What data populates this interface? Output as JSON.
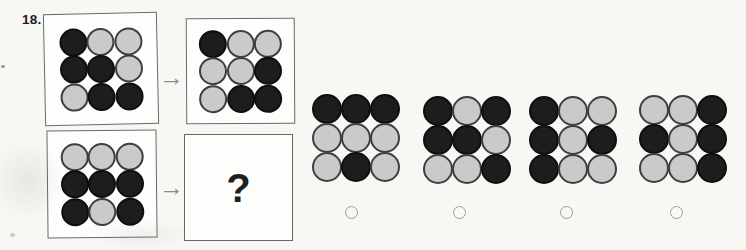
{
  "question": {
    "number": "18.",
    "question_mark": "?"
  },
  "icons": {
    "arrow": "→"
  },
  "colors": {
    "paper": "#f7f7f4",
    "box_bg": "#fdfdfc",
    "box_border": "#686868",
    "dark": "#1d1d1d",
    "dark_ring": "#0e0e0e",
    "light": "#cacaca",
    "light_ring": "#3e3e3e",
    "arrow": "#8d8d8d",
    "radio_border": "#9c9c9c"
  },
  "example": {
    "input_grid": [
      [
        "dark",
        "light",
        "light"
      ],
      [
        "dark",
        "dark",
        "light"
      ],
      [
        "light",
        "dark",
        "dark"
      ]
    ],
    "output_grid": [
      [
        "dark",
        "light",
        "light"
      ],
      [
        "light",
        "light",
        "dark"
      ],
      [
        "light",
        "dark",
        "dark"
      ]
    ]
  },
  "problem": {
    "input_grid": [
      [
        "light",
        "light",
        "light"
      ],
      [
        "dark",
        "dark",
        "dark"
      ],
      [
        "dark",
        "light",
        "dark"
      ]
    ]
  },
  "options": [
    {
      "id": "option-1",
      "grid": [
        [
          "dark",
          "dark",
          "dark"
        ],
        [
          "light",
          "light",
          "light"
        ],
        [
          "light",
          "dark",
          "light"
        ]
      ],
      "selected": false
    },
    {
      "id": "option-2",
      "grid": [
        [
          "dark",
          "light",
          "dark"
        ],
        [
          "dark",
          "dark",
          "light"
        ],
        [
          "light",
          "light",
          "dark"
        ]
      ],
      "selected": false
    },
    {
      "id": "option-3",
      "grid": [
        [
          "dark",
          "light",
          "light"
        ],
        [
          "dark",
          "light",
          "dark"
        ],
        [
          "dark",
          "light",
          "light"
        ]
      ],
      "selected": false
    },
    {
      "id": "option-4",
      "grid": [
        [
          "light",
          "light",
          "dark"
        ],
        [
          "dark",
          "light",
          "dark"
        ],
        [
          "light",
          "light",
          "dark"
        ]
      ],
      "selected": false
    }
  ]
}
